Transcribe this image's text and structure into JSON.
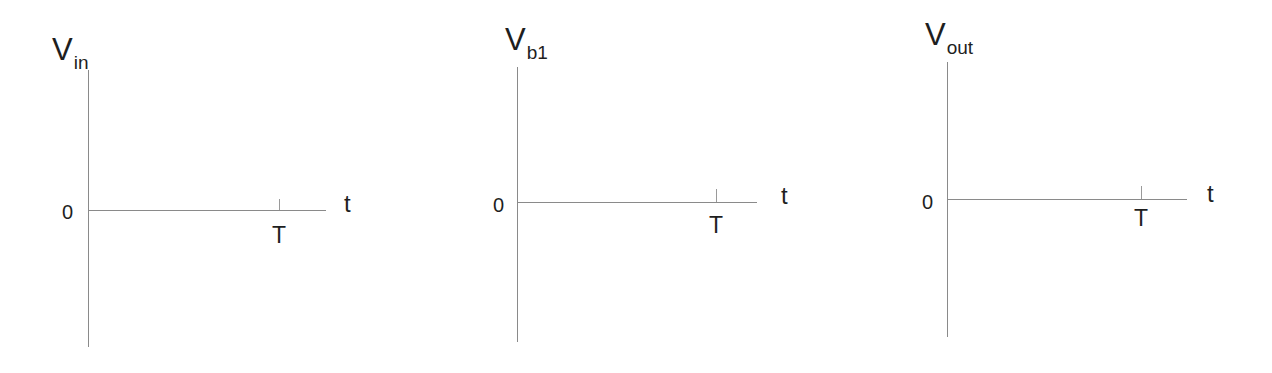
{
  "diagram": {
    "line_color": "#8a8a8a",
    "text_color": "#1e1e1e",
    "plots": [
      {
        "id": "vin",
        "y_label_main": "V",
        "y_label_sub": "in",
        "origin_label": "0",
        "x_label": "t",
        "tick_label": "T",
        "geometry": {
          "left": 0,
          "v_axis_x": 88,
          "v_axis_top": 70,
          "v_axis_bottom": 347,
          "h_axis_y": 210,
          "h_axis_right": 326,
          "tick_x": 279,
          "tick_top": 199,
          "title_x": 52,
          "title_y": 34,
          "zero_x": 62,
          "zero_y": 202,
          "t_x": 344,
          "t_y": 192,
          "T_x": 279,
          "T_y": 224
        }
      },
      {
        "id": "vb1",
        "y_label_main": "V",
        "y_label_sub": "b1",
        "origin_label": "0",
        "x_label": "t",
        "tick_label": "T",
        "geometry": {
          "left": 0,
          "v_axis_x": 517,
          "v_axis_top": 67,
          "v_axis_bottom": 342,
          "h_axis_y": 202,
          "h_axis_right": 757,
          "tick_x": 716,
          "tick_top": 189,
          "title_x": 505,
          "title_y": 24,
          "zero_x": 493,
          "zero_y": 195,
          "t_x": 781,
          "t_y": 184,
          "T_x": 716,
          "T_y": 214
        }
      },
      {
        "id": "vout",
        "y_label_main": "V",
        "y_label_sub": "out",
        "origin_label": "0",
        "x_label": "t",
        "tick_label": "T",
        "geometry": {
          "left": 0,
          "v_axis_x": 947,
          "v_axis_top": 62,
          "v_axis_bottom": 337,
          "h_axis_y": 199,
          "h_axis_right": 1187,
          "tick_x": 1141,
          "tick_top": 186,
          "title_x": 925,
          "title_y": 19,
          "zero_x": 922,
          "zero_y": 192,
          "t_x": 1207,
          "t_y": 182,
          "T_x": 1141,
          "T_y": 207
        }
      }
    ]
  }
}
